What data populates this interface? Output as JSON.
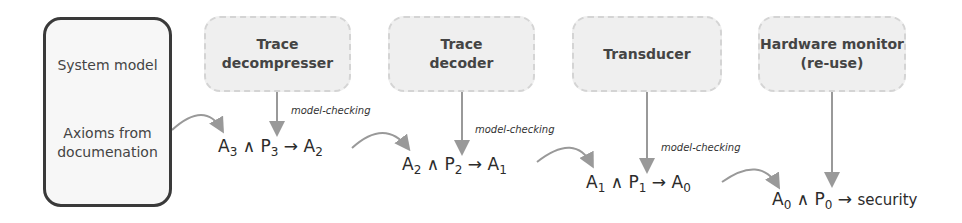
{
  "system_box": {
    "title": "System model",
    "subtitle_line1": "Axioms from",
    "subtitle_line2": "documenation"
  },
  "components": [
    {
      "line1": "Trace",
      "line2": "decompresser"
    },
    {
      "line1": "Trace",
      "line2": "decoder"
    },
    {
      "line1": "Transducer",
      "line2": ""
    },
    {
      "line1": "Hardware monitor",
      "line2": "(re-use)"
    }
  ],
  "formulas": [
    {
      "a": "A",
      "a_sub": "3",
      "and": "∧",
      "p": "P",
      "p_sub": "3",
      "arrow": "→",
      "r": "A",
      "r_sub": "2"
    },
    {
      "a": "A",
      "a_sub": "2",
      "and": "∧",
      "p": "P",
      "p_sub": "2",
      "arrow": "→",
      "r": "A",
      "r_sub": "1"
    },
    {
      "a": "A",
      "a_sub": "1",
      "and": "∧",
      "p": "P",
      "p_sub": "1",
      "arrow": "→",
      "r": "A",
      "r_sub": "0"
    },
    {
      "a": "A",
      "a_sub": "0",
      "and": "∧",
      "p": "P",
      "p_sub": "0",
      "arrow": "→",
      "r": "security",
      "r_sub": ""
    }
  ],
  "edge_labels": [
    "model-checking",
    "model-checking",
    "model-checking"
  ],
  "colors": {
    "arrow": "#999999",
    "box_border": "#3a3a3a",
    "component_fill": "#efefef"
  }
}
